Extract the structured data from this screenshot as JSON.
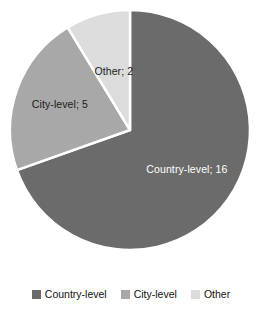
{
  "chart_data": {
    "type": "pie",
    "title": "",
    "categories": [
      "Country-level",
      "City-level",
      "Other"
    ],
    "values": [
      16,
      5,
      2
    ],
    "total": 23,
    "colors": [
      "#6b6b6b",
      "#a8a8a8",
      "#dcdcdc"
    ],
    "separator_color": "#ffffff",
    "start_angle_deg": 0,
    "direction": "clockwise",
    "legend_position": "bottom",
    "grid": false,
    "data_labels": [
      {
        "text": "Country-level; 16",
        "category": "Country-level",
        "value": 16,
        "color": "#ffffff"
      },
      {
        "text": "City-level; 5",
        "category": "City-level",
        "value": 5,
        "color": "#1a1a1a"
      },
      {
        "text": "Other; 2",
        "category": "Other",
        "value": 2,
        "color": "#1a1a1a"
      }
    ],
    "legend_entries": [
      {
        "label": "Country-level",
        "color": "#6b6b6b"
      },
      {
        "label": "City-level",
        "color": "#a8a8a8"
      },
      {
        "label": "Other",
        "color": "#dcdcdc"
      }
    ]
  },
  "slices": {
    "country": {
      "label": "Country-level; 16",
      "path": "M 130 130 L 130 10 A 120 120 0 1 1 23.4 185.3 Z",
      "color": "#6b6b6b",
      "label_x": 196,
      "label_y": 142,
      "label_color": "#ffffff"
    },
    "city": {
      "label": "City-level; 5",
      "path": "M 130 130 L 23.4 185.3 A 120 120 0 0 1 55.2 25.7 Z",
      "color": "#a8a8a8",
      "label_x": 54,
      "label_y": 95,
      "label_color": "#1a1a1a"
    },
    "other": {
      "label": "Other; 2",
      "path": "M 130 130 L 55.2 25.7 A 120 120 0 0 1 130 10 Z",
      "color": "#dcdcdc",
      "label_x": 104,
      "label_y": 40,
      "label_color": "#1a1a1a"
    }
  },
  "legend": {
    "items": [
      {
        "label": "Country-level",
        "color": "#6b6b6b"
      },
      {
        "label": "City-level",
        "color": "#a8a8a8"
      },
      {
        "label": "Other",
        "color": "#dcdcdc"
      }
    ]
  }
}
